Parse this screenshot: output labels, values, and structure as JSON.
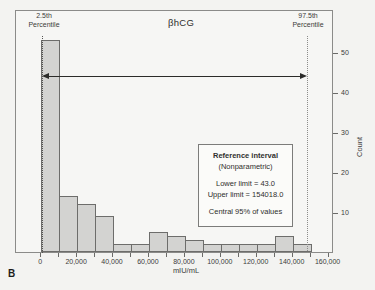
{
  "figure_label": "B",
  "chart_data": {
    "type": "bar",
    "title": "βhCG",
    "xlabel": "mIU/mL",
    "ylabel": "Count",
    "bin_start": 0,
    "bin_width": 10000,
    "counts": [
      53,
      14,
      12,
      9,
      2,
      2,
      5,
      4,
      3,
      2,
      2,
      2,
      2,
      4,
      2
    ],
    "xlim": [
      -14000,
      163000
    ],
    "ylim": [
      0,
      60.75
    ],
    "x_tick_values": [
      0,
      20000,
      40000,
      60000,
      80000,
      100000,
      120000,
      140000,
      160000
    ],
    "x_tick_labels": [
      "0",
      "20,000",
      "40,000",
      "60,000",
      "80,000",
      "100,000",
      "120,000",
      "140,000",
      "160,000"
    ],
    "x_minor_tick_values": [
      10000,
      30000,
      50000,
      70000,
      90000,
      110000,
      130000,
      150000
    ],
    "y_tick_values": [
      10,
      20,
      30,
      40,
      50
    ],
    "y_tick_labels": [
      "10",
      "20",
      "30",
      "40",
      "50"
    ],
    "legend": "none",
    "grid": "off",
    "annotations": {
      "left_percentile": {
        "line1": "2.5th",
        "line2": "Percentile"
      },
      "right_percentile": {
        "line1": "97.5th",
        "line2": "Percentile"
      }
    }
  },
  "reference_box": {
    "title": "Reference interval",
    "subtitle": "(Nonparametric)",
    "lower_limit": "Lower limit = 43.0",
    "upper_limit": "Upper limit = 154018.0",
    "note": "Central 95% of values"
  }
}
